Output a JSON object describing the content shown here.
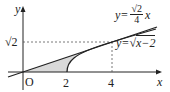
{
  "diagram": {
    "type": "function-graph",
    "axes": {
      "x_label": "x",
      "y_label": "y",
      "origin_label": "O"
    },
    "x_ticks": [
      "2",
      "4"
    ],
    "y_ticks": [
      "√2"
    ],
    "curves": [
      {
        "name": "line",
        "label_lhs": "y=",
        "label_num": "√2",
        "label_den": "4",
        "label_var": "x"
      },
      {
        "name": "sqrt-curve",
        "label": "y=√(x−2)",
        "label_lhs": "y=",
        "label_rad": "x−2"
      }
    ],
    "intersection": {
      "x": "4",
      "y": "√2"
    },
    "shaded_region": "between y=(√2/4)x and y=√(x−2) from x=0 to x=4",
    "colors": {
      "stroke": "#222222",
      "shade": "#d9d9d9",
      "dashed": "#555555"
    }
  }
}
